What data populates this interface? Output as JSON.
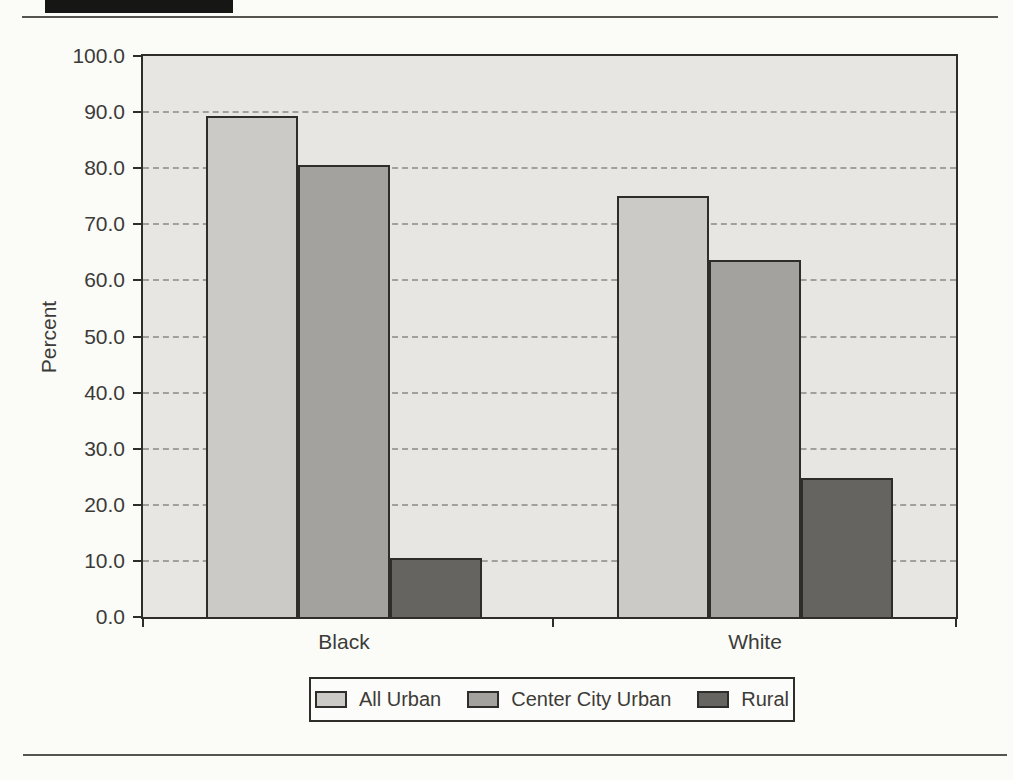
{
  "page": {
    "top_rule": "horizontal divider",
    "bottom_rule": "horizontal divider",
    "header_tab": "solid black header band (cropped at page top)"
  },
  "chart_data": {
    "type": "bar",
    "title": "",
    "xlabel": "",
    "ylabel": "Percent",
    "categories": [
      "Black",
      "White"
    ],
    "series": [
      {
        "name": "All Urban",
        "color": "#cbcac7",
        "values": [
          89.3,
          75.0
        ]
      },
      {
        "name": "Center City Urban",
        "color": "#a3a29f",
        "values": [
          80.5,
          63.6
        ]
      },
      {
        "name": "Rural",
        "color": "#656460",
        "values": [
          10.5,
          24.7
        ]
      }
    ],
    "ylim": [
      0,
      100
    ],
    "ytick_step": 10,
    "ytick_labels": [
      "0.0",
      "10.0",
      "20.0",
      "30.0",
      "40.0",
      "50.0",
      "60.0",
      "70.0",
      "80.0",
      "90.0",
      "100.0"
    ],
    "grid": "horizontal dashed gridlines at every 10 units",
    "legend_position": "bottom",
    "colors": {
      "plot_background": "#e7e6e3",
      "gridline": "#a0a09d",
      "axis": "#2e2d2a",
      "text": "#3c3b38",
      "page_background": "#fbfbf8",
      "header_band": "#161614"
    }
  }
}
